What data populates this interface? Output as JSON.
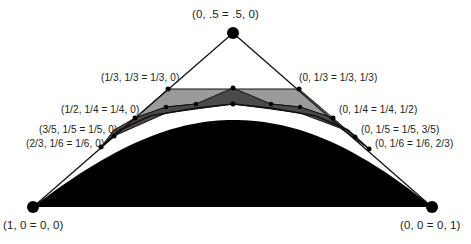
{
  "diagram": {
    "colors": {
      "lines": "#111111",
      "dome": "#000000",
      "light_polygon": "#9a9a9a",
      "dark_polygon": "#4a4a4a",
      "background": "#ffffff"
    },
    "vertices": {
      "top": {
        "label": "(0, .5 = .5, 0)",
        "x": 233,
        "y": 33
      },
      "bottom_left": {
        "label": "(1, 0  = 0, 0)",
        "x": 33,
        "y": 207
      },
      "bottom_right": {
        "label": "(0, 0 = 0, 1)",
        "x": 432,
        "y": 207
      }
    },
    "left_points": [
      {
        "label": "(1/3, 1/3 = 1/3, 0)",
        "x": 168,
        "y": 89
      },
      {
        "label": "(1/2, 1/4 = 1/4, 0)",
        "x": 135,
        "y": 118
      },
      {
        "label": "(3/5, 1/5 = 1/5, 0)",
        "x": 114,
        "y": 136
      },
      {
        "label": "(2/3, 1/6 = 1/6, 0)",
        "x": 101,
        "y": 147
      }
    ],
    "right_points": [
      {
        "label": "(0, 1/3 = 1/3, 1/3)",
        "x": 299,
        "y": 89
      },
      {
        "label": "(0, 1/4 = 1/4, 1/2)",
        "x": 333,
        "y": 118
      },
      {
        "label": "(0, 1/5 = 1/5, 3/5)",
        "x": 355,
        "y": 137
      },
      {
        "label": "(0, 1/6 = 1/6, 2/3)",
        "x": 369,
        "y": 149
      }
    ]
  }
}
